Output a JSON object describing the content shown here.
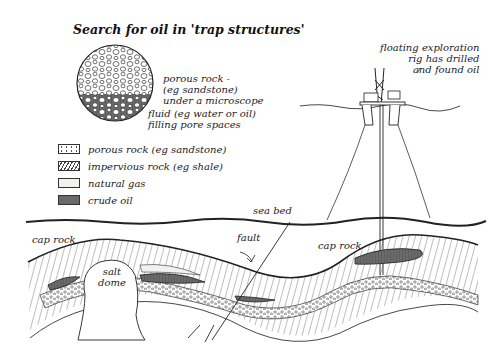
{
  "title": "Search for oil in 'trap structures'",
  "microscope": {
    "label_rock": [
      "porous rock -",
      "(eg sandstone)",
      "under a microscope"
    ],
    "label_fluid": [
      "fluid (eg water or oil)",
      "filling pore spaces"
    ]
  },
  "legend": [
    {
      "key": "porous",
      "label": "porous rock (eg sandstone)"
    },
    {
      "key": "impervious",
      "label": "impervious rock (eg shale)"
    },
    {
      "key": "gas",
      "label": "natural gas"
    },
    {
      "key": "oil",
      "label": "crude oil"
    }
  ],
  "rig_label": [
    "floating exploration",
    "rig has drilled",
    "and found oil"
  ],
  "labels": {
    "sea_bed": "sea bed",
    "fault": "fault",
    "cap_rock_left": "cap rock",
    "cap_rock_right": "cap rock",
    "salt_dome": [
      "salt",
      "dome"
    ]
  },
  "colors": {
    "ink": "#222222",
    "oil": "#6a6a6a",
    "gas": "#f1f1ee",
    "paper": "#ffffff"
  }
}
